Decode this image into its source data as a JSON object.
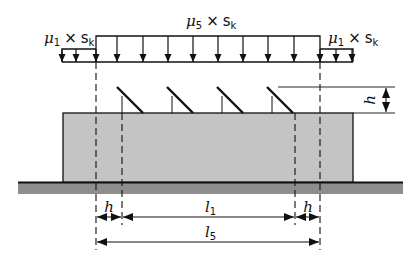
{
  "diagram": {
    "colors": {
      "line": "#111111",
      "building_fill": "#c4c4c4",
      "ground_fill": "#8e8e8e",
      "background": "#ffffff"
    },
    "loads": {
      "left": {
        "mu": "μ",
        "mu_sub": "1",
        "times": "×",
        "s": "s",
        "s_sub": "k"
      },
      "middle": {
        "mu": "μ",
        "mu_sub": "5",
        "times": "×",
        "s": "s",
        "s_sub": "k"
      },
      "right": {
        "mu": "μ",
        "mu_sub": "1",
        "times": "×",
        "s": "s",
        "s_sub": "k"
      }
    },
    "panel_count": 4,
    "dimensions": {
      "panel_height": "h",
      "edge_left": "h",
      "edge_right": "h",
      "inner_length": {
        "base": "l",
        "sub": "1"
      },
      "total_length": {
        "base": "l",
        "sub": "5"
      }
    }
  }
}
